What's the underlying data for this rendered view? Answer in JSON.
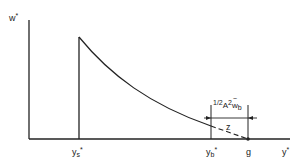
{
  "diagram": {
    "type": "decay-curve-profile",
    "axes": {
      "y_axis_label": "w",
      "y_axis_label_sup": "*",
      "x_axis_label": "y",
      "x_axis_label_sup": "*"
    },
    "x_ticks": {
      "ys": {
        "base": "y",
        "sub": "s",
        "sup": "*"
      },
      "yb": {
        "base": "y",
        "sub": "b",
        "sup": "*"
      },
      "g": "g"
    },
    "annotation": {
      "top_prefix": "1/2",
      "top_A": "A",
      "top_exp": "2",
      "top_w": "w",
      "top_w_tilde": "~",
      "top_w_sub": "b",
      "bottom": "z"
    },
    "colors": {
      "line": "#222222",
      "background": "#ffffff"
    }
  }
}
